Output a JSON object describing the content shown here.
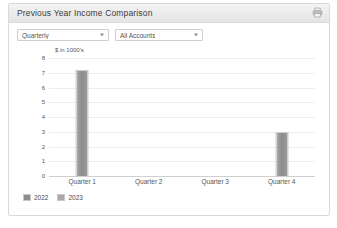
{
  "panel": {
    "title": "Previous Year Income Comparison",
    "print_icon": "print-icon"
  },
  "toolbar": {
    "period_select": {
      "value": "Quarterly",
      "options": [
        "Quarterly"
      ]
    },
    "account_select": {
      "value": "All Accounts",
      "options": [
        "All Accounts"
      ]
    }
  },
  "legend": [
    {
      "label": "2022",
      "color": "#8e8e8e"
    },
    {
      "label": "2023",
      "color": "#a8a8a8"
    }
  ],
  "chart_data": {
    "type": "bar",
    "title": "",
    "subtitle": "",
    "xlabel": "",
    "ylabel": "$ in 1000's",
    "categories": [
      "Quarter 1",
      "Quarter 2",
      "Quarter 3",
      "Quarter 4"
    ],
    "series": [
      {
        "name": "2022",
        "values": [
          7.2,
          0,
          0,
          3.0
        ]
      },
      {
        "name": "2023",
        "values": [
          0,
          0,
          0,
          0
        ]
      }
    ],
    "values": [
      7.2,
      0,
      0,
      3.0
    ],
    "ylim": [
      0,
      8
    ],
    "yticks": [
      0,
      1,
      2,
      3,
      4,
      5,
      6,
      7,
      8
    ],
    "ytick_labels": [
      "0",
      "1",
      "2",
      "3",
      "4",
      "5",
      "6",
      "7",
      "8"
    ],
    "grid": true,
    "legend_position": "bottom-left"
  }
}
